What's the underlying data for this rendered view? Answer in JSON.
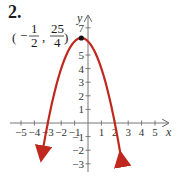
{
  "problem_label": "2.",
  "chart_data": {
    "type": "line",
    "title": "",
    "function": "y = -(x + 1/2)^2 + 25/4",
    "xlabel": "x",
    "ylabel": "y",
    "xlim": [
      -5.5,
      5.5
    ],
    "ylim": [
      -4,
      7.5
    ],
    "x_ticks": [
      -5,
      -4,
      -3,
      -2,
      -1,
      1,
      2,
      3,
      4,
      5
    ],
    "y_ticks": [
      -3,
      -2,
      -1,
      1,
      2,
      3,
      4,
      5,
      7
    ],
    "x_tick_labels": [
      "−5",
      "−4",
      "−3",
      "−2",
      "−1",
      "1",
      "2",
      "3",
      "4",
      "5"
    ],
    "y_tick_labels": [
      "−3",
      "−2",
      "−1",
      "1",
      "2",
      "3",
      "4",
      "5",
      "7"
    ],
    "grid": false,
    "series": [
      {
        "name": "parabola",
        "color": "#c0281e",
        "x": [
          -3.45,
          -3,
          -2,
          -1,
          -0.5,
          0,
          1,
          2,
          2.45
        ],
        "y": [
          -2.45,
          0,
          4,
          6,
          6.25,
          6,
          4,
          0,
          -2.45
        ]
      }
    ],
    "annotations": [
      {
        "point": [
          -0.5,
          6.25
        ],
        "label": "(−1/2, 25/4)",
        "marker": "dot"
      }
    ],
    "x_intercepts": [
      -3,
      2
    ]
  },
  "annotation": {
    "open": "(",
    "minus": "−",
    "num1": "1",
    "den1": "2",
    "comma": ",",
    "num2": "25",
    "den2": "4",
    "close": ")"
  },
  "axes": {
    "x_name": "x",
    "y_name": "y"
  },
  "colors": {
    "curve": "#c0281e",
    "axis": "#555555",
    "vertex": "#111111"
  }
}
